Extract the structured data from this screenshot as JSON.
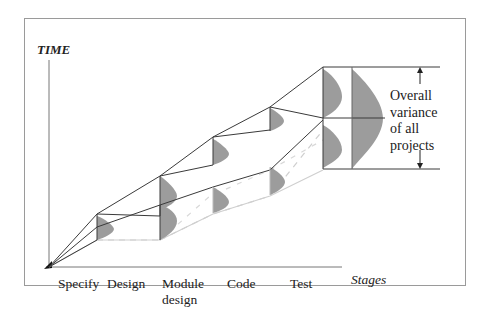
{
  "diagram": {
    "y_axis_label": "TIME",
    "x_axis_label": "Stages",
    "stages": [
      {
        "label": "Specify"
      },
      {
        "label": "Design"
      },
      {
        "label": "Module",
        "label2": "design"
      },
      {
        "label": "Code"
      },
      {
        "label": "Test"
      }
    ],
    "annotation": {
      "line1": "Overall",
      "line2": "variance",
      "line3": "of all",
      "line4": "projects"
    },
    "colors": {
      "line": "#3a3a3a",
      "curve_fill": "#9c9c9c",
      "dashed": "#c8c8c8",
      "frame": "#9a9a9a"
    }
  }
}
